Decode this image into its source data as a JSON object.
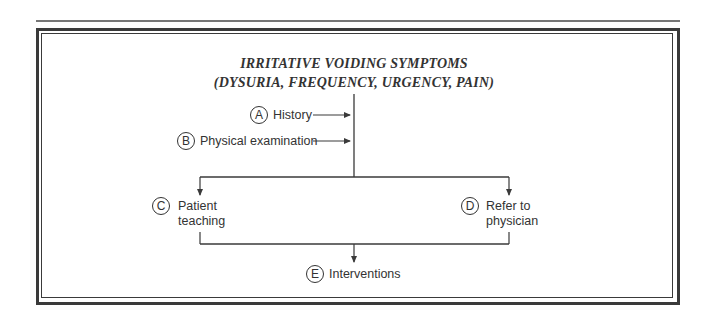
{
  "title": {
    "line1": "IRRITATIVE VOIDING SYMPTOMS",
    "line2": "(DYSURIA, FREQUENCY, URGENCY, PAIN)"
  },
  "nodes": {
    "a": {
      "letter": "A",
      "label": "History"
    },
    "b": {
      "letter": "B",
      "label": "Physical examination"
    },
    "c": {
      "letter": "C",
      "label_line1": "Patient",
      "label_line2": "teaching"
    },
    "d": {
      "letter": "D",
      "label_line1": "Refer to",
      "label_line2": "physician"
    },
    "e": {
      "letter": "E",
      "label": "Interventions"
    }
  },
  "colors": {
    "line": "#3a3a3a",
    "text": "#333333"
  }
}
